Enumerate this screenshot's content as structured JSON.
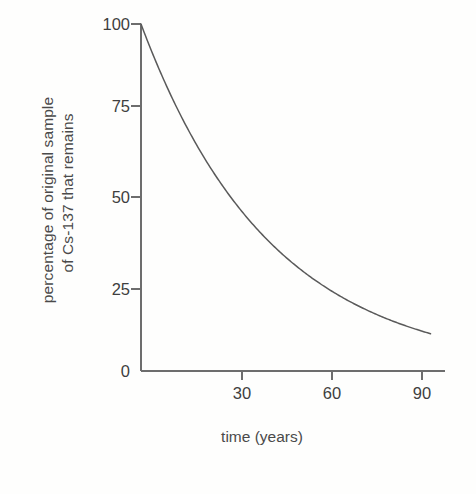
{
  "chart_data": {
    "type": "line",
    "title": "",
    "subtitle": "",
    "xlabel": "time (years)",
    "ylabel_lines": [
      "percentage of original sample",
      "of Cs-137 that remains"
    ],
    "ylabel": "percentage of original sample of Cs-137 that remains",
    "xlim": [
      0,
      93
    ],
    "ylim": [
      0,
      103
    ],
    "xticks": [
      30,
      60,
      90
    ],
    "xtick_labels": [
      "30",
      "60",
      "90"
    ],
    "yticks": [
      0,
      25,
      50,
      75,
      100
    ],
    "ytick_labels": [
      "0",
      "25",
      "50",
      "75",
      "100"
    ],
    "grid": false,
    "legend": false,
    "legend_position": "none",
    "annotations": [],
    "series": [
      {
        "name": "Cs-137 remaining",
        "x": [
          0,
          5,
          10,
          15,
          20,
          25,
          30,
          35,
          40,
          45,
          50,
          55,
          60,
          65,
          70,
          75,
          80,
          85,
          90,
          93
        ],
        "values": [
          100,
          89,
          79,
          70,
          63,
          56,
          50,
          44,
          39.7,
          35.4,
          31.5,
          28.1,
          25,
          22.3,
          19.8,
          17.7,
          15.7,
          14,
          12.5,
          11.6
        ]
      }
    ],
    "half_life_years": 30,
    "curve_description": "exponential decay, halving every 30 years"
  },
  "style": {
    "ink_color": "#4a4a4a",
    "curve_color": "#5a5a5a",
    "axis_color": "#6a6a6a",
    "background": "#fefefd"
  }
}
